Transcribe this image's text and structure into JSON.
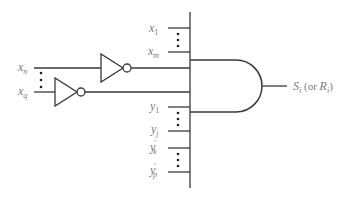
{
  "diagram": {
    "type": "logic-circuit",
    "colors": {
      "line": "#3a3a3a",
      "label": "#7a7a7a",
      "background": "#ffffff"
    },
    "direct_x_inputs": {
      "first": {
        "base": "x",
        "sub": "1"
      },
      "last": {
        "base": "x",
        "sub": "m"
      }
    },
    "inverted_inputs": {
      "first": {
        "base": "x",
        "sub": "n"
      },
      "last": {
        "base": "x",
        "sub": "q"
      }
    },
    "y_inputs": [
      {
        "base": "y",
        "sub": "1",
        "prime": ""
      },
      {
        "base": "y",
        "sub": "j",
        "prime": ""
      },
      {
        "base": "y",
        "sub": "k",
        "prime": "′"
      },
      {
        "base": "y",
        "sub": "p",
        "prime": "′"
      }
    ],
    "gate": {
      "kind": "AND"
    },
    "output": {
      "main": "S",
      "main_sub": "i",
      "alt_open": " (or ",
      "alt": "R",
      "alt_sub": "i",
      "alt_close": ")"
    }
  }
}
